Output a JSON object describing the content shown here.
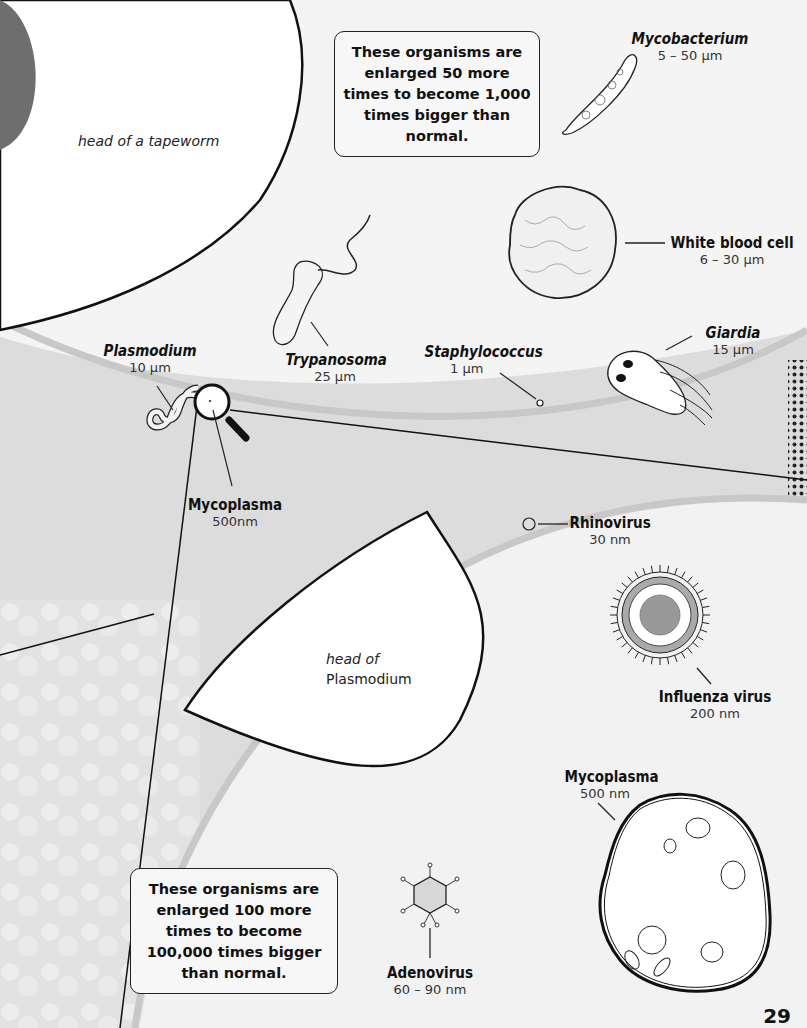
{
  "page_number": "29",
  "info_boxes": [
    {
      "id": "magnify-1000",
      "text": "These organisms are enlarged 50 more times to become 1,000 times bigger than normal."
    },
    {
      "id": "magnify-100000",
      "text": "These organisms are enlarged 100 more times to become 100,000 times bigger than normal."
    }
  ],
  "captions": {
    "tapeworm_head": "head of a tapeworm",
    "plasmodium_head_line1": "head of",
    "plasmodium_head_line2": "Plasmodium"
  },
  "organisms_1000x": [
    {
      "name": "Mycobacterium",
      "size": "5 – 50 µm",
      "italic": true
    },
    {
      "name": "White blood cell",
      "size": "6 – 30 µm",
      "italic": false
    },
    {
      "name": "Trypanosoma",
      "size": "25 µm",
      "italic": true
    },
    {
      "name": "Staphylococcus",
      "size": "1 µm",
      "italic": true
    },
    {
      "name": "Giardia",
      "size": "15 µm",
      "italic": true
    },
    {
      "name": "Plasmodium",
      "size": "10 µm",
      "italic": true
    },
    {
      "name": "Mycoplasma",
      "size": "500nm",
      "italic": false
    }
  ],
  "organisms_100000x": [
    {
      "name": "Rhinovirus",
      "size": "30 nm"
    },
    {
      "name": "Influenza virus",
      "size": "200 nm"
    },
    {
      "name": "Mycoplasma",
      "size": "500 nm"
    },
    {
      "name": "Adenovirus",
      "size": "60 – 90 nm"
    }
  ],
  "colors": {
    "background": "#e6e6e6",
    "panel": "#f4f4f4",
    "rim": "#c8c8c8",
    "ink": "#111111",
    "dark_disc": "#6e6e6e"
  }
}
